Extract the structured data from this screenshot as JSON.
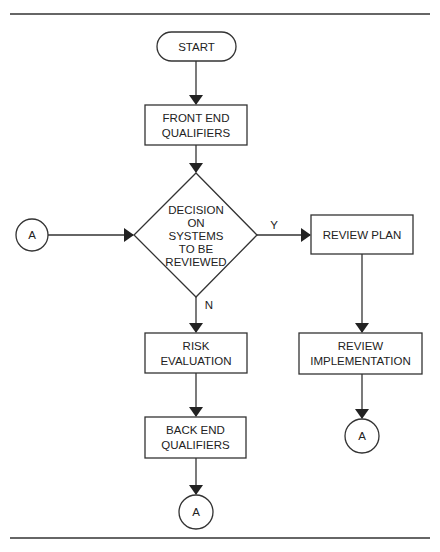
{
  "diagram": {
    "type": "flowchart",
    "nodes": {
      "start": {
        "label": "START",
        "shape": "terminator"
      },
      "front_end": {
        "line1": "FRONT END",
        "line2": "QUALIFIERS",
        "shape": "process"
      },
      "decision": {
        "line1": "DECISION",
        "line2": "ON",
        "line3": "SYSTEMS",
        "line4": "TO BE",
        "line5": "REVIEWED",
        "shape": "decision"
      },
      "connector_in": {
        "label": "A",
        "shape": "connector"
      },
      "review_plan": {
        "label": "REVIEW PLAN",
        "shape": "process"
      },
      "review_impl": {
        "line1": "REVIEW",
        "line2": "IMPLEMENTATION",
        "shape": "process"
      },
      "connector_right": {
        "label": "A",
        "shape": "connector"
      },
      "risk_eval": {
        "line1": "RISK",
        "line2": "EVALUATION",
        "shape": "process"
      },
      "back_end": {
        "line1": "BACK END",
        "line2": "QUALIFIERS",
        "shape": "process"
      },
      "connector_bottom": {
        "label": "A",
        "shape": "connector"
      }
    },
    "edges": {
      "yes_label": "Y",
      "no_label": "N"
    },
    "colors": {
      "stroke": "#333333",
      "background": "#ffffff"
    }
  }
}
